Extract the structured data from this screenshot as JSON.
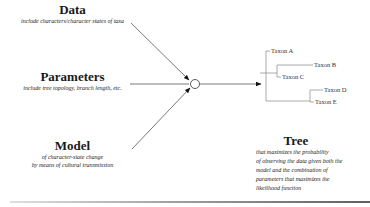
{
  "inputs": [
    {
      "title": "Data",
      "subtitle": [
        "include characters/character states of taxa"
      ]
    },
    {
      "title": "Parameters",
      "subtitle": [
        "include tree topology, branch length, etc."
      ]
    },
    {
      "title": "Model",
      "subtitle": [
        "of character-state change",
        "by means of cultural transmission"
      ]
    }
  ],
  "tree": {
    "taxa": [
      "Taxon A",
      "Taxon B",
      "Taxon C",
      "Taxon D",
      "Taxon E"
    ]
  },
  "output": {
    "title": "Tree",
    "subtitle": [
      "that maximizes the probability",
      "of observing the data given both the",
      "model and the combination of",
      "parameters that maximizes the",
      "likelihood function"
    ]
  },
  "colors": {
    "line": "#555555",
    "arrow": "#111111",
    "tree_line": "#888888"
  }
}
